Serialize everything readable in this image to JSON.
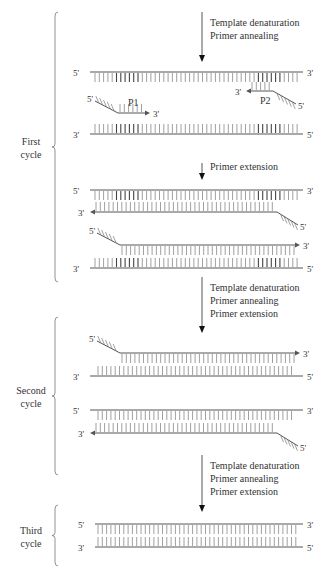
{
  "colors": {
    "strand": "#555555",
    "base": "#888888",
    "base_dark": "#444444",
    "arrow": "#111111",
    "text": "#333333"
  },
  "cycles": [
    {
      "label_line1": "First",
      "label_line2": "cycle",
      "brace": [
        12,
        282
      ]
    },
    {
      "label_line1": "Second",
      "label_line2": "cycle",
      "brace": [
        317,
        475
      ]
    },
    {
      "label_line1": "Third",
      "label_line2": "cycle",
      "brace": [
        505,
        566
      ]
    }
  ],
  "steps": [
    {
      "arrow_y": [
        12,
        62
      ],
      "lines": [
        "Template denaturation",
        "Primer annealing"
      ]
    },
    {
      "arrow_y": [
        163,
        180
      ],
      "lines": [
        "Primer extension"
      ]
    },
    {
      "arrow_y": [
        277,
        333
      ],
      "lines": [
        "Template denaturation",
        "Primer annealing",
        "Primer extension"
      ]
    },
    {
      "arrow_y": [
        455,
        512
      ],
      "lines": [
        "Template denaturation",
        "Primer annealing",
        "Primer extension"
      ]
    }
  ],
  "primers": {
    "p1": "P1",
    "p2": "P2"
  },
  "end_labels": {
    "five": "5'",
    "three": "3'"
  }
}
